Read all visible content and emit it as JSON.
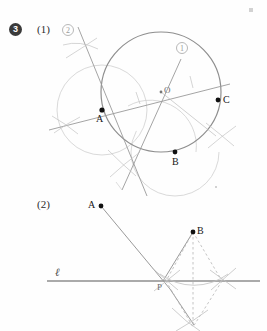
{
  "page": {
    "width": 267,
    "height": 331,
    "background": "#fefefe",
    "problem_number": "3"
  },
  "colors": {
    "ink_dark": "#1a1a1a",
    "construction_grey": "#a9a9a9",
    "construction_light": "#c3c3c3",
    "main_line": "#8e8e8e",
    "label_grey": "#9a9a9a",
    "badge_fill": "#3a3a3a"
  },
  "part1": {
    "number_label": "(1)",
    "circle_label": "①",
    "line_label": "②",
    "points": [
      {
        "name": "A",
        "label": "A",
        "x": 102,
        "y": 110,
        "label_x": 97,
        "label_y": 117
      },
      {
        "name": "B",
        "label": "B",
        "x": 175,
        "y": 152,
        "label_x": 172,
        "label_y": 160
      },
      {
        "name": "C",
        "label": "C",
        "x": 218,
        "y": 100,
        "label_x": 223,
        "label_y": 95
      },
      {
        "name": "O",
        "label": "O",
        "x": 161,
        "y": 92,
        "label_x": 164,
        "label_y": 86
      }
    ],
    "circumcircle": {
      "cx": 161,
      "cy": 92,
      "r": 60
    },
    "label_positions": {
      "circle_label_x": 176,
      "circle_label_y": 43,
      "line_label_x": 62,
      "line_label_y": 25
    }
  },
  "part2": {
    "number_label": "(2)",
    "line_label": "ℓ",
    "points": [
      {
        "name": "A",
        "label": "A",
        "x": 101,
        "y": 206,
        "label_x": 89,
        "label_y": 201
      },
      {
        "name": "B",
        "label": "B",
        "x": 193,
        "y": 232,
        "label_x": 197,
        "label_y": 227
      },
      {
        "name": "P",
        "label": "P",
        "x": 166,
        "y": 281,
        "label_x": 158,
        "label_y": 284
      }
    ],
    "line_l": {
      "x1": 47,
      "y1": 281,
      "x2": 260,
      "y2": 281
    },
    "reflected_point": {
      "name": "B'",
      "x": 193,
      "y": 327
    },
    "label_positions": {
      "number_x": 38,
      "number_y": 200,
      "ell_x": 55,
      "ell_y": 268
    }
  }
}
